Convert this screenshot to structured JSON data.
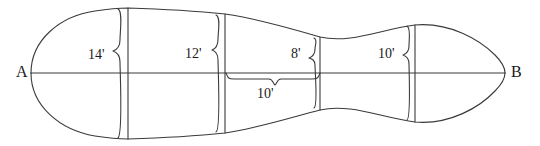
{
  "figure": {
    "stroke_color": "#3a3a3a",
    "background": "#ffffff",
    "baseline": {
      "start_label": "A",
      "end_label": "B",
      "start_point": [
        31,
        73
      ],
      "end_point": [
        505,
        73
      ]
    },
    "offsets": [
      {
        "name": "offset-1",
        "label": "14'",
        "value": 14,
        "unit": "ft",
        "x": 128,
        "top_y": 8,
        "bottom_y": 139,
        "label_x": 88,
        "label_y": 48
      },
      {
        "name": "offset-2",
        "label": "12'",
        "value": 12,
        "unit": "ft",
        "x": 225,
        "top_y": 14,
        "bottom_y": 133,
        "label_x": 185,
        "label_y": 47
      },
      {
        "name": "offset-3",
        "label": "8'",
        "value": 8,
        "unit": "ft",
        "x": 320,
        "top_y": 37,
        "bottom_y": 110,
        "label_x": 291,
        "label_y": 47
      },
      {
        "name": "offset-4",
        "label": "10'",
        "value": 10,
        "unit": "ft",
        "x": 415,
        "top_y": 25,
        "bottom_y": 122,
        "label_x": 378,
        "label_y": 47
      }
    ],
    "spacing": {
      "name": "spacing-dimension",
      "label": "10'",
      "value": 10,
      "unit": "ft",
      "from_x": 225,
      "to_x": 320,
      "y": 80,
      "label_x": 257,
      "label_y": 87
    },
    "outline": {
      "top_path": "M31,73 C31,40 60,16 95,11 C108,9 118,8 128,8 C160,9 196,11 225,14 C254,18 286,27 320,37 C350,44 382,29 415,25 C450,22 480,40 495,55 C502,62 505,68 505,73",
      "bottom_path": "M31,73 C31,106 60,130 95,136 C108,138 118,139 128,139 C160,138 196,136 225,133 C254,129 286,119 320,110 C350,103 382,118 415,122 C450,125 480,107 495,91 C502,84 505,78 505,73"
    }
  }
}
